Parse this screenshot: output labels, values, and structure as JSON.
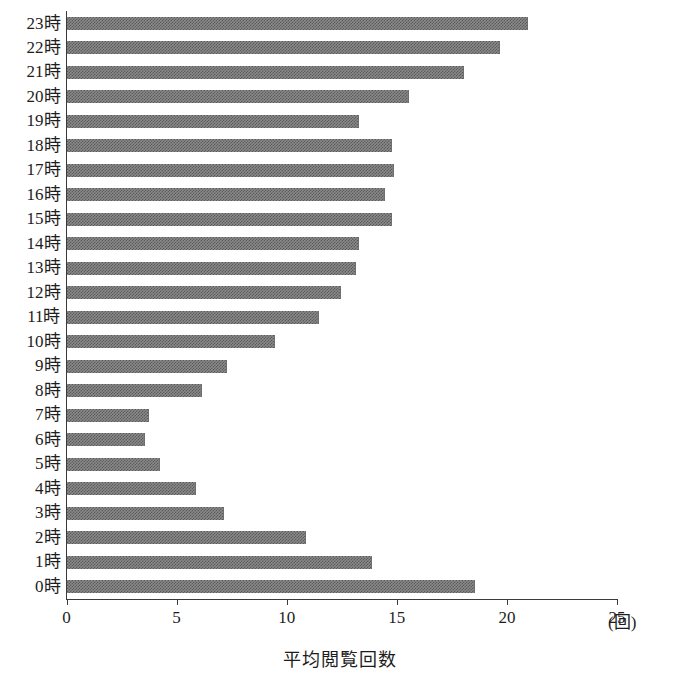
{
  "chart_data": {
    "type": "bar",
    "orientation": "horizontal",
    "title": "",
    "xlabel": "平均閲覧回数",
    "ylabel": "",
    "x_unit_label": "(回)",
    "xlim": [
      0,
      25
    ],
    "xticks": [
      0,
      5,
      10,
      15,
      20,
      25
    ],
    "xtick_labels": [
      "0",
      "5",
      "10",
      "15",
      "20",
      "25"
    ],
    "grid": false,
    "legend": false,
    "bar_color": "#8a8a8a",
    "axis_color": "#3a3a3a",
    "categories": [
      "23時",
      "22時",
      "21時",
      "20時",
      "19時",
      "18時",
      "17時",
      "16時",
      "15時",
      "14時",
      "13時",
      "12時",
      "11時",
      "10時",
      "9時",
      "8時",
      "7時",
      "6時",
      "5時",
      "4時",
      "3時",
      "2時",
      "1時",
      "0時"
    ],
    "values": [
      20.9,
      19.6,
      18.0,
      15.5,
      13.2,
      14.7,
      14.8,
      14.4,
      14.7,
      13.2,
      13.1,
      12.4,
      11.4,
      9.4,
      7.2,
      6.1,
      3.7,
      3.5,
      4.2,
      5.8,
      7.1,
      10.8,
      13.8,
      18.5
    ]
  }
}
